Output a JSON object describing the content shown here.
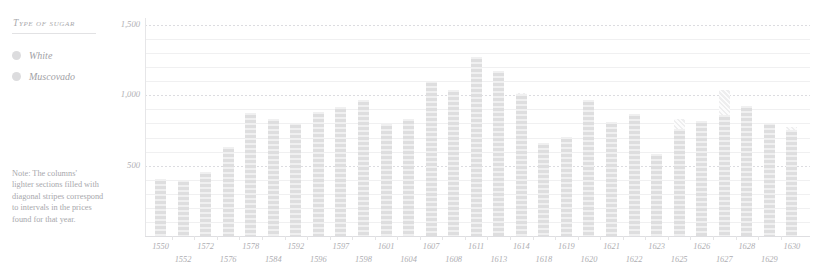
{
  "legend": {
    "title": "Type of sugar",
    "items": [
      {
        "label": "White",
        "color": "#dcdcde",
        "icon": "circle-swatch-icon"
      },
      {
        "label": "Muscovado",
        "color": "#dcdcde",
        "icon": "circle-swatch-icon"
      }
    ]
  },
  "note": {
    "lines": [
      "Note: The columns'",
      "lighter sections filled with",
      "diagonal stripes correspond",
      "to intervals in the prices",
      "found for that year."
    ]
  },
  "chart_data": {
    "type": "bar",
    "title": "",
    "subtitle": "",
    "xlabel": "",
    "ylabel": "",
    "ylim": [
      0,
      1500
    ],
    "yticks": [
      500,
      1000,
      1500
    ],
    "ytick_labels": [
      "500",
      "1,000",
      "1,500"
    ],
    "minor_tick_step": 100,
    "grid": true,
    "legend_position": "left",
    "categories": [
      "1550",
      "1552",
      "1572",
      "1576",
      "1578",
      "1584",
      "1592",
      "1596",
      "1597",
      "1598",
      "1601",
      "1604",
      "1607",
      "1608",
      "1611",
      "1613",
      "1614",
      "1618",
      "1619",
      "1620",
      "1621",
      "1622",
      "1623",
      "1625",
      "1626",
      "1627",
      "1628",
      "1629",
      "1630"
    ],
    "values": [
      405,
      395,
      455,
      630,
      875,
      835,
      800,
      880,
      915,
      965,
      795,
      830,
      1105,
      1040,
      1275,
      1170,
      1010,
      660,
      705,
      965,
      810,
      865,
      580,
      760,
      815,
      860,
      925,
      805,
      755
    ],
    "stripe_cap_tops": [
      null,
      null,
      null,
      null,
      null,
      null,
      null,
      null,
      null,
      null,
      null,
      null,
      null,
      null,
      null,
      null,
      1015,
      null,
      null,
      null,
      null,
      null,
      null,
      830,
      null,
      1035,
      920,
      null,
      775
    ],
    "series": [
      {
        "name": "White",
        "values": [
          405,
          395,
          455,
          630,
          875,
          835,
          800,
          880,
          915,
          965,
          795,
          830,
          1105,
          1040,
          1275,
          1170,
          1010,
          660,
          705,
          965,
          810,
          865,
          580,
          760,
          815,
          860,
          925,
          805,
          755
        ]
      }
    ]
  }
}
